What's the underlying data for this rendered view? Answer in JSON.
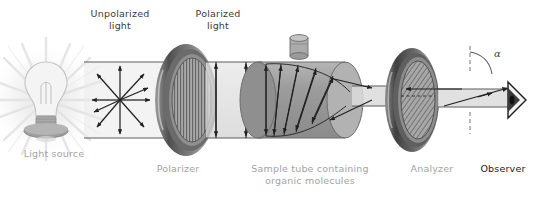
{
  "figure": {
    "background_color": "#ffffff"
  },
  "labels": {
    "unpolarized_light": "Unpolarized\nlight",
    "polarized_light": "Polarized\nlight",
    "light_source": "Light source",
    "polarizer": "Polarizer",
    "sample_tube": "Sample tube containing\norganic molecules",
    "analyzer": "Analyzer",
    "observer": "Observer",
    "angle_symbol": "α"
  },
  "colors": {
    "label_dark": "#3b3b3b",
    "label_gray": "#a3a3a3",
    "label_black": "#1a1a1a",
    "disc_rim_dark": "#5a5a5a",
    "disc_rim_light": "#b8b8b8",
    "disc_face": "#9a9a9a",
    "tube_body": "#9b9b9b",
    "tube_end": "#b0b0b0",
    "beam": "#d9d9d9",
    "bulb_glow": "#ededed",
    "bulb_base": "#9f9f9f",
    "arrow_stroke": "#2a2a2a",
    "dashed_line": "#8c8c8c"
  },
  "components": {
    "light_source": {
      "type": "light-bulb",
      "ray_count": 16
    },
    "unpolarized_beam": {
      "type": "multi-direction-arrows",
      "arrow_count": 8
    },
    "polarizer": {
      "type": "disc",
      "hatch": "vertical",
      "hatch_angle_deg": 90
    },
    "polarized_beam": {
      "type": "vertical-plane-arrows",
      "arrow_count": 2
    },
    "sample_tube": {
      "type": "cylinder",
      "has_stopper": true,
      "plane_count": 5
    },
    "analyzer": {
      "type": "disc",
      "hatch": "diagonal",
      "hatch_angle_deg": 35
    },
    "observer": {
      "type": "eye-triangle"
    },
    "rotation_angle": {
      "symbol": "α",
      "reference": "vertical-dashed-line"
    }
  }
}
